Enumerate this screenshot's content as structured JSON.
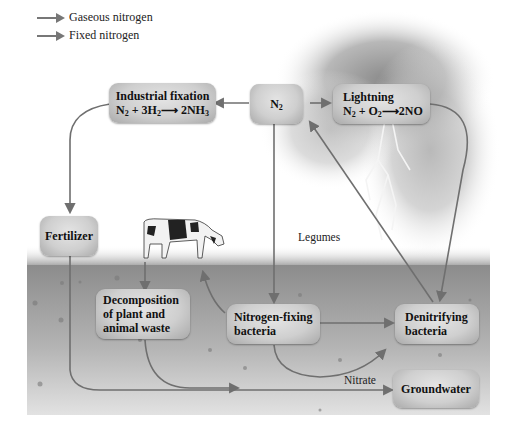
{
  "legend": [
    {
      "label": "Gaseous nitrogen",
      "color": "#777777"
    },
    {
      "label": "Fixed nitrogen",
      "color": "#777777"
    }
  ],
  "nodes": {
    "industrial_fixation": {
      "title": "Industrial fixation",
      "equation": {
        "a": "N",
        "a_sub": "2",
        "b": " + 3H",
        "b_sub": "2",
        "arrow": "⟶",
        "c": " 2NH",
        "c_sub": "3"
      }
    },
    "n2": {
      "title": "N",
      "sub": "2"
    },
    "lightning": {
      "title": "Lightning",
      "equation": {
        "a": "N",
        "a_sub": "2",
        "b": " + O",
        "b_sub": "2",
        "arrow": "⟶",
        "c": "2NO"
      }
    },
    "fertilizer": {
      "title": "Fertilizer"
    },
    "decomposition": {
      "lines": [
        "Decomposition",
        "of plant and",
        "animal waste"
      ]
    },
    "nitrogen_fixing": {
      "lines": [
        "Nitrogen-fixing",
        "bacteria"
      ]
    },
    "denitrifying": {
      "lines": [
        "Denitrifying",
        "bacteria"
      ]
    },
    "groundwater": {
      "title": "Groundwater"
    }
  },
  "labels": {
    "legumes": "Legumes",
    "nitrate": "Nitrate"
  },
  "colors": {
    "arrow": "#6f6f6f",
    "soil_top": "#8e8e8e",
    "soil_bottom": "#dcdcdc",
    "box_fill": "#cfcfcf"
  }
}
